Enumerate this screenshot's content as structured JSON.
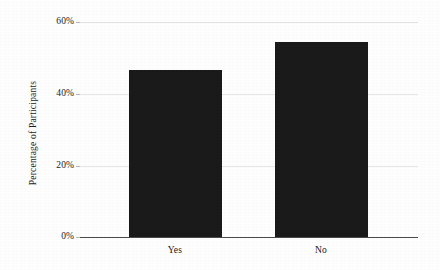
{
  "chart_data": {
    "type": "bar",
    "title": "",
    "subtitle": "",
    "xlabel": "",
    "ylabel": "Percentage of Participants",
    "categories": [
      "Yes",
      "No"
    ],
    "values": [
      46.5,
      54.5
    ],
    "series": [
      {
        "name": "Percentage of Participants",
        "values": [
          46.5,
          54.5
        ]
      }
    ],
    "ylim": [
      0,
      60
    ],
    "ytick_labels": [
      "0%",
      "20%",
      "40%",
      "60%"
    ],
    "ytick_values": [
      0,
      20,
      40,
      60
    ],
    "xtick_labels": [
      "Yes",
      "No"
    ],
    "grid": true,
    "legend": false,
    "bar_color": "#1a1a1a",
    "axis_color": "#4a4a4a",
    "grid_color": "#e2e2e2",
    "background": "#fefefe"
  },
  "axes": {
    "y_title": "Percentage of Participants",
    "ticks": [
      {
        "label": "60%",
        "value": 60
      },
      {
        "label": "40%",
        "value": 40
      },
      {
        "label": "20%",
        "value": 20
      },
      {
        "label": "0%",
        "value": 0
      }
    ]
  },
  "bars": [
    {
      "category": "Yes",
      "value": 46.5,
      "label": "Yes"
    },
    {
      "category": "No",
      "value": 54.5,
      "label": "No"
    }
  ]
}
